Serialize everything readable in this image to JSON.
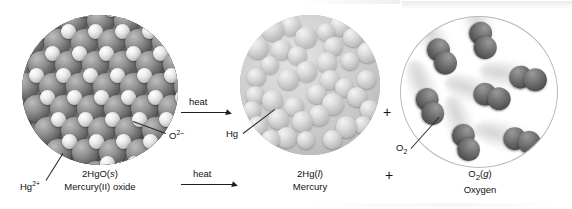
{
  "figure": {
    "kind": "chemical-reaction-diagram"
  },
  "reactant": {
    "particle_labels": [
      {
        "name": "mercury-ion",
        "text": "Hg",
        "sup": "2+"
      },
      {
        "name": "oxide-ion",
        "text": "O",
        "sup": "2–"
      }
    ],
    "formula": "2HgO(s)",
    "formula_main": "2HgO(",
    "formula_state": "s",
    "formula_close": ")",
    "name": "Mercury(II) oxide"
  },
  "arrows": [
    {
      "label": "heat"
    },
    {
      "label": "heat"
    }
  ],
  "products": [
    {
      "id": "mercury",
      "particle_label": "Hg",
      "formula_main": "2Hg(",
      "formula_state": "l",
      "formula_close": ")",
      "name": "Mercury"
    },
    {
      "id": "oxygen",
      "particle_label_text": "O",
      "particle_label_sub": "2",
      "formula_main": "O",
      "formula_sub": "2",
      "formula_open": "(",
      "formula_state": "g",
      "formula_close": ")",
      "name": "Oxygen"
    }
  ],
  "operators": {
    "plus_upper": "+",
    "plus_lower": "+"
  },
  "colors": {
    "mercury_ion": "#6d6d6d",
    "oxide_ion": "#e8e8e8",
    "mercury_liquid": "#cfcfcf",
    "oxygen_atom": "#5a5a5a",
    "background": "#ffffff",
    "outline": "#b9b9b9",
    "text": "#111111"
  },
  "chart_data": {
    "type": "diagram",
    "equation": "2HgO(s) --heat--> 2Hg(l) + O2(g)",
    "panels": [
      {
        "label": "2HgO(s)",
        "sublabel": "Mercury(II) oxide",
        "species": [
          "Hg2+",
          "O2-"
        ],
        "phase": "solid",
        "representation": "ionic lattice"
      },
      {
        "label": "2Hg(l)",
        "sublabel": "Mercury",
        "species": [
          "Hg"
        ],
        "phase": "liquid",
        "representation": "close-packed atoms"
      },
      {
        "label": "O2(g)",
        "sublabel": "Oxygen",
        "species": [
          "O2"
        ],
        "phase": "gas",
        "representation": "dispersed diatomic molecules",
        "molecule_count": 7
      }
    ]
  }
}
